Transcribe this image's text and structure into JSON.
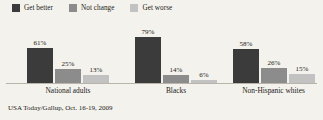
{
  "chart_data": {
    "type": "bar",
    "title": "",
    "subtitle": "",
    "xlabel": "",
    "ylabel": "",
    "ylim": [
      0,
      100
    ],
    "grid": false,
    "legend_position": "top-left",
    "categories": [
      "National adults",
      "Blacks",
      "Non-Hispanic whites"
    ],
    "series": [
      {
        "name": "Get better",
        "color": "#3b3b3b",
        "values": [
          61,
          25,
          58
        ],
        "labels": [
          "61%",
          "25%",
          "58%"
        ]
      },
      {
        "name": "Not change",
        "color": "#8c8c8c",
        "values": [
          25,
          14,
          26
        ],
        "labels": [
          "25%",
          "14%",
          "26%"
        ]
      },
      {
        "name": "Get worse",
        "color": "#c2c2c2",
        "values": [
          13,
          6,
          15
        ],
        "labels": [
          "13%",
          "6%",
          "15%"
        ]
      }
    ],
    "groups": [
      {
        "category": "National adults",
        "bars": [
          {
            "series": "Get better",
            "value": 61,
            "label": "61%",
            "color": "#3b3b3b"
          },
          {
            "series": "Not change",
            "value": 25,
            "label": "25%",
            "color": "#8c8c8c"
          },
          {
            "series": "Get worse",
            "value": 13,
            "label": "13%",
            "color": "#c2c2c2"
          }
        ]
      },
      {
        "category": "Blacks",
        "bars": [
          {
            "series": "Get better",
            "value": 79,
            "label": "79%",
            "color": "#3b3b3b"
          },
          {
            "series": "Not change",
            "value": 14,
            "label": "14%",
            "color": "#8c8c8c"
          },
          {
            "series": "Get worse",
            "value": 6,
            "label": "6%",
            "color": "#c2c2c2"
          }
        ]
      },
      {
        "category": "Non-Hispanic whites",
        "bars": [
          {
            "series": "Get better",
            "value": 58,
            "label": "58%",
            "color": "#3b3b3b"
          },
          {
            "series": "Not change",
            "value": 26,
            "label": "26%",
            "color": "#8c8c8c"
          },
          {
            "series": "Get worse",
            "value": 15,
            "label": "15%",
            "color": "#c2c2c2"
          }
        ]
      }
    ],
    "source": "USA Today/Gallup, Oct. 16-19, 2009"
  },
  "legend": {
    "items": [
      {
        "label": "Get better",
        "color": "#3b3b3b"
      },
      {
        "label": "Not change",
        "color": "#8c8c8c"
      },
      {
        "label": "Get worse",
        "color": "#c2c2c2"
      }
    ]
  },
  "axis": {
    "baseline_color": "#b9b4aa"
  },
  "background": "#f4f2ec",
  "source_note": "USA Today/Gallup, Oct. 16-19, 2009"
}
